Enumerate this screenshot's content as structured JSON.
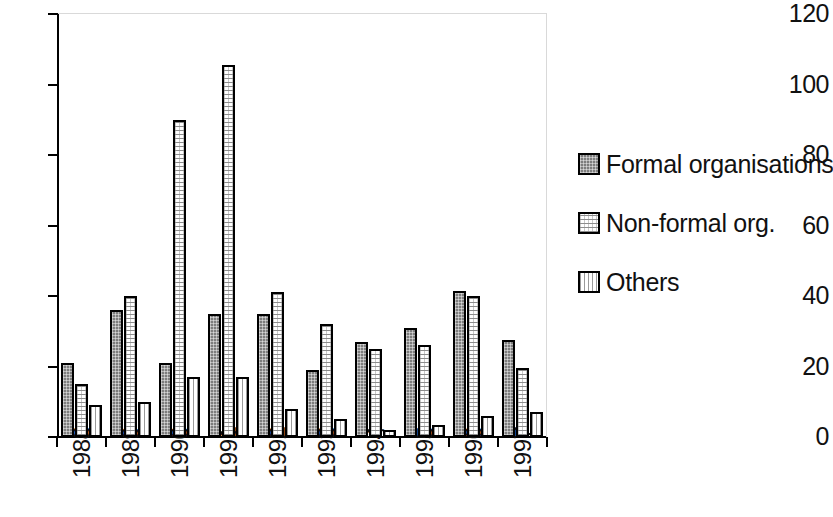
{
  "chart_data": {
    "type": "bar",
    "title": "",
    "subtitle": "",
    "xlabel": "",
    "ylabel": "",
    "categories": [
      "1988",
      "1989",
      "1990",
      "1991",
      "1992",
      "1993",
      "1994",
      "1995",
      "1996",
      "1997"
    ],
    "series": [
      {
        "name": "Formal organisations",
        "values": [
          21,
          36,
          21,
          35,
          35,
          19,
          27,
          31,
          41.5,
          27.5
        ],
        "color": "#7d7d7d",
        "pattern": "solid-dark-gray"
      },
      {
        "name": "Non-formal org.",
        "values": [
          15,
          40,
          90,
          105.5,
          41,
          32,
          25,
          26,
          40,
          19.5
        ],
        "color": "#ffffff",
        "pattern": "cross-hatch-light"
      },
      {
        "name": "Others",
        "values": [
          9,
          10,
          17,
          17,
          8,
          5,
          2,
          3.5,
          6,
          7
        ],
        "color": "#ffffff",
        "pattern": "vertical-lines-light"
      }
    ],
    "ylim": [
      0,
      120
    ],
    "y_ticks": [
      "0",
      "20",
      "40",
      "60",
      "80",
      "100",
      "120"
    ],
    "y_tick_values": [
      0,
      20,
      40,
      60,
      80,
      100,
      120
    ],
    "grid": false,
    "legend_position": "right"
  },
  "legend": {
    "items": [
      {
        "label": "Formal organisations"
      },
      {
        "label": "Non-formal org."
      },
      {
        "label": "Others"
      }
    ]
  }
}
